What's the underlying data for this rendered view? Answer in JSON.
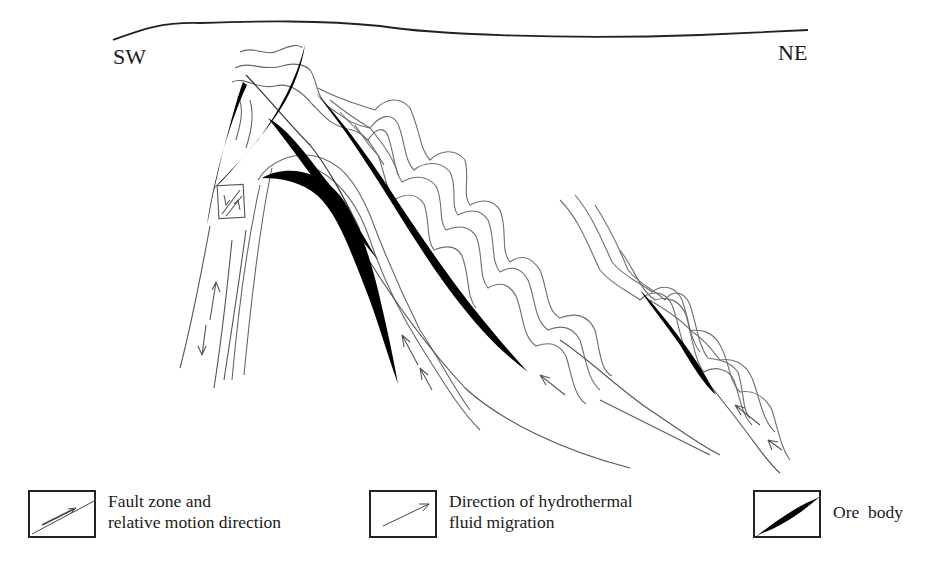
{
  "diagram": {
    "type": "geological-cross-section",
    "orientation_labels": {
      "left": "SW",
      "right": "NE"
    },
    "elements": [
      "ground-surface-line",
      "folded-strata",
      "anticline",
      "ore-bodies",
      "fault-zones",
      "hydrothermal-fluid-arrows",
      "fault-motion-box"
    ]
  },
  "legend": {
    "items": [
      {
        "icon": "fault-zone-icon",
        "label_line1": "Fault zone and",
        "label_line2": "relative motion direction"
      },
      {
        "icon": "fluid-arrow-icon",
        "label_line1": "Direction of hydrothermal",
        "label_line2": "fluid migration"
      },
      {
        "icon": "ore-body-icon",
        "label_line1": "Ore  body",
        "label_line2": ""
      }
    ]
  },
  "colors": {
    "ink": "#1a1a1a",
    "strata_line": "#6e6e6e",
    "ore_fill": "#000000",
    "background": "#ffffff"
  }
}
